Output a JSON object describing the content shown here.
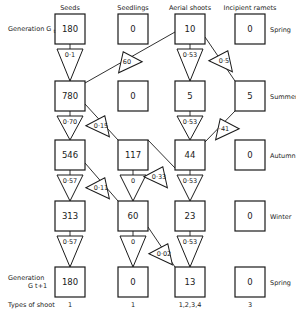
{
  "columns": [
    {
      "label": "Seeds",
      "x": 70
    },
    {
      "label": "Seedlings",
      "x": 133
    },
    {
      "label": "Aerial shoots",
      "x": 190
    },
    {
      "label": "Incipient ramets",
      "x": 250
    }
  ],
  "generation_start": {
    "label": "Generation G",
    "subscript": "t"
  },
  "generation_end": {
    "label": "Generation",
    "subscript": "G t+1"
  },
  "seasons": [
    "Spring",
    "Summer",
    "Autumn",
    "Winter",
    "Spring"
  ],
  "rows": [
    {
      "season": "Spring",
      "values": [
        "180",
        "0",
        "10",
        "0"
      ]
    },
    {
      "season": "Summer",
      "values": [
        "780",
        "0",
        "5",
        "5"
      ]
    },
    {
      "season": "Autumn",
      "values": [
        "546",
        "117",
        "44",
        "0"
      ]
    },
    {
      "season": "Winter",
      "values": [
        "313",
        "60",
        "23",
        "0"
      ]
    },
    {
      "season": "Spring",
      "values": [
        "180",
        "0",
        "13",
        "0"
      ]
    }
  ],
  "vertical_transitions": [
    {
      "from_row": 0,
      "col": 0,
      "value": "0·1"
    },
    {
      "from_row": 0,
      "col": 2,
      "value": "0·53"
    },
    {
      "from_row": 1,
      "col": 0,
      "value": "0·70"
    },
    {
      "from_row": 1,
      "col": 2,
      "value": "0·53"
    },
    {
      "from_row": 2,
      "col": 0,
      "value": "0·57"
    },
    {
      "from_row": 2,
      "col": 1,
      "value": "0"
    },
    {
      "from_row": 2,
      "col": 2,
      "value": "0·53"
    },
    {
      "from_row": 3,
      "col": 0,
      "value": "0·57"
    },
    {
      "from_row": 3,
      "col": 1,
      "value": "0"
    },
    {
      "from_row": 3,
      "col": 2,
      "value": "0·53"
    }
  ],
  "diagonal_transitions": [
    {
      "from": "Aerial shoots Spring",
      "to": "Seeds Summer",
      "value": "60"
    },
    {
      "from": "Aerial shoots Spring",
      "to": "Incipient ramets Summer",
      "value": "0·5"
    },
    {
      "from": "Seeds Summer",
      "to": "Seedlings Autumn",
      "value": "0·15"
    },
    {
      "from": "Incipient ramets Summer",
      "to": "Aerial shoots Autumn",
      "value": "·41"
    },
    {
      "from": "Seedlings Autumn",
      "to": "Aerial shoots Autumn",
      "value": "0·33"
    },
    {
      "from": "Seeds Autumn",
      "to": "Seedlings Winter",
      "value": "0·11"
    },
    {
      "from": "Seedlings Winter",
      "to": "Aerial shoots Spring G t+1",
      "value": "0·02"
    }
  ],
  "types_of_shoot": {
    "label": "Types of shoot",
    "values": [
      "1",
      "1",
      "1,2,3,4",
      "3"
    ]
  }
}
